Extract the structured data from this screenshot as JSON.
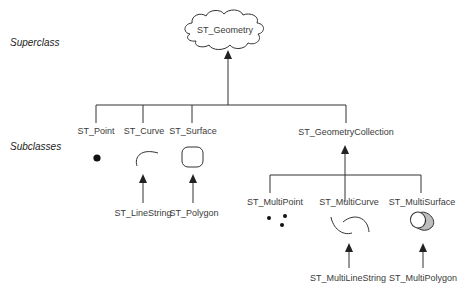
{
  "diagram": {
    "side_labels": {
      "superclass": "Superclass",
      "subclasses": "Subclasses"
    },
    "root": {
      "label": "ST_Geometry",
      "shape": "cloud-icon"
    },
    "level1": [
      {
        "label": "ST_Point",
        "icon": "point-icon"
      },
      {
        "label": "ST_Curve",
        "icon": "curve-icon",
        "child": "ST_LineString"
      },
      {
        "label": "ST_Surface",
        "icon": "surface-icon",
        "child": "ST_Polygon"
      },
      {
        "label": "ST_GeometryCollection"
      }
    ],
    "collection_children": [
      {
        "label": "ST_MultiPoint",
        "icon": "multipoint-icon"
      },
      {
        "label": "ST_MultiCurve",
        "icon": "multicurve-icon",
        "child": "ST_MultiLineString"
      },
      {
        "label": "ST_MultiSurface",
        "icon": "multisurface-icon",
        "child": "ST_MultiPolygon"
      }
    ],
    "colors": {
      "line": "#333333",
      "text": "#3a3a3a",
      "surface_fill": "#bdbdbd"
    }
  }
}
